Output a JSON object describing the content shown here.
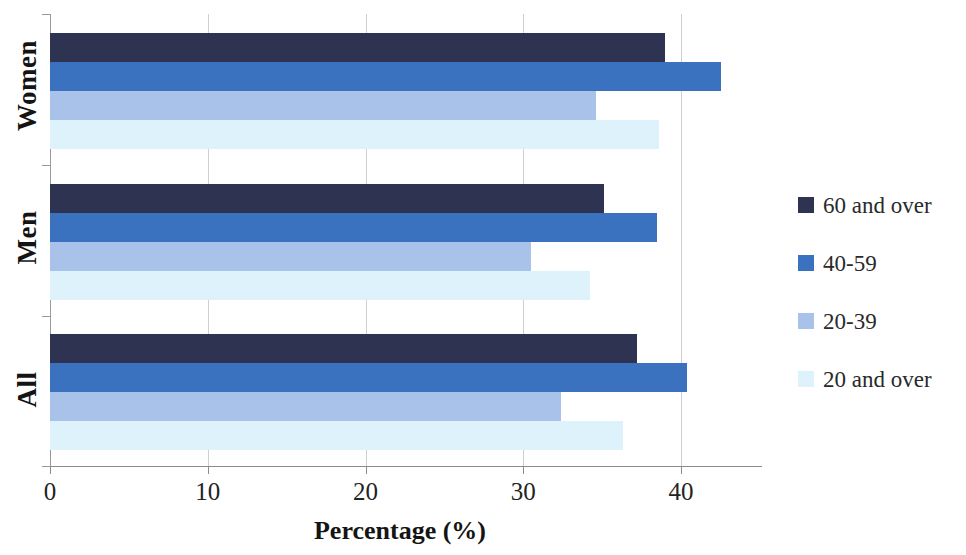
{
  "chart_data": {
    "type": "bar",
    "orientation": "horizontal",
    "title": "",
    "xlabel": "Percentage (%)",
    "ylabel": "",
    "categories": [
      "Women",
      "Men",
      "All"
    ],
    "xlim": [
      0,
      45
    ],
    "xticks": [
      0,
      10,
      20,
      30,
      40
    ],
    "xticklabels": [
      "0",
      "10",
      "20",
      "30",
      "40"
    ],
    "grid": "vertical",
    "legend_position": "right",
    "series": [
      {
        "name": "60 and over",
        "color": "#2d3350",
        "values": [
          39.0,
          35.1,
          37.2
        ]
      },
      {
        "name": "40-59",
        "color": "#3b72c0",
        "values": [
          42.5,
          38.5,
          40.4
        ]
      },
      {
        "name": "20-39",
        "color": "#a9c2ea",
        "values": [
          34.6,
          30.5,
          32.4
        ]
      },
      {
        "name": "20 and over",
        "color": "#ddf2fa",
        "values": [
          38.6,
          34.2,
          36.3
        ]
      }
    ]
  },
  "axis": {
    "x_title": "Percentage (%)",
    "tick_labels": [
      "0",
      "10",
      "20",
      "30",
      "40"
    ],
    "category_labels": [
      "Women",
      "Men",
      "All"
    ]
  },
  "legend": {
    "items": [
      {
        "label": "60 and over",
        "color": "#2d3350"
      },
      {
        "label": "40-59",
        "color": "#3b72c0"
      },
      {
        "label": "20-39",
        "color": "#a9c2ea"
      },
      {
        "label": "20 and over",
        "color": "#ddf2fa"
      }
    ]
  },
  "colors": {
    "axis": "#8b8b8b",
    "grid": "#cfcfcf",
    "text": "#1a1a1a",
    "background": "#ffffff"
  }
}
